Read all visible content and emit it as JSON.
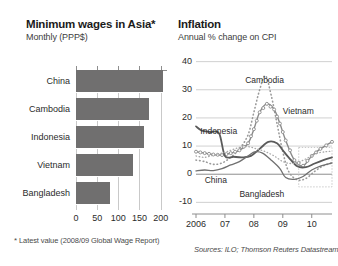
{
  "left": {
    "title": "Minimum wages in Asia*",
    "subtitle": "Monthly (PPP$)",
    "footnote_star": "*",
    "footnote": " Latest value (2008/09 Global Wage Report)"
  },
  "right": {
    "title": "Inflation",
    "subtitle": "Annual % change on CPI",
    "sources": "Sources: ILO; Thomson Reuters Datastream"
  },
  "chart_data": [
    {
      "type": "bar",
      "title": "Minimum wages in Asia*",
      "subtitle": "Monthly (PPP$)",
      "orientation": "horizontal",
      "categories": [
        "China",
        "Cambodia",
        "Indonesia",
        "Vietnam",
        "Bangladesh"
      ],
      "values": [
        205,
        172,
        160,
        135,
        80
      ],
      "xlabel": "",
      "ylabel": "",
      "xlim": [
        0,
        215
      ],
      "xticks": [
        0,
        50,
        100,
        150,
        200
      ],
      "xtick_labels": [
        "0",
        "50",
        "100",
        "150",
        "200"
      ],
      "grid": true,
      "bar_color": "#706f6f",
      "legend": "none"
    },
    {
      "type": "line",
      "title": "Inflation",
      "subtitle": "Annual % change on CPI",
      "xlabel": "",
      "ylabel": "",
      "ylim": [
        -12,
        42
      ],
      "yticks": [
        -10,
        0,
        10,
        20,
        30,
        40
      ],
      "ytick_labels": [
        "-10",
        "0",
        "10",
        "20",
        "30",
        "40"
      ],
      "xlim": [
        2006.0,
        2010.7
      ],
      "xticks": [
        2006,
        2007,
        2008,
        2009,
        2010
      ],
      "xtick_labels": [
        "2006",
        "07",
        "08",
        "09",
        "10"
      ],
      "grid": true,
      "legend": "inline-annotations",
      "series": [
        {
          "name": "Cambodia",
          "style": "dotted",
          "color": "#9a9a9a",
          "x": [
            2006.0,
            2006.3,
            2006.6,
            2006.9,
            2007.2,
            2007.5,
            2007.8,
            2008.0,
            2008.2,
            2008.4,
            2008.6,
            2008.8,
            2009.0,
            2009.2,
            2009.5,
            2009.8,
            2010.1,
            2010.4,
            2010.7
          ],
          "values": [
            5.0,
            4.5,
            3.5,
            4.0,
            6.0,
            9.0,
            14.0,
            22.0,
            30.0,
            35.0,
            28.0,
            18.0,
            8.0,
            1.0,
            -2.0,
            -1.5,
            1.0,
            3.0,
            4.0
          ]
        },
        {
          "name": "Vietnam",
          "style": "circle-markers",
          "color": "#8a8a8a",
          "x": [
            2006.0,
            2006.3,
            2006.6,
            2006.9,
            2007.2,
            2007.5,
            2007.8,
            2008.0,
            2008.2,
            2008.45,
            2008.7,
            2008.9,
            2009.1,
            2009.4,
            2009.7,
            2010.0,
            2010.3,
            2010.7
          ],
          "values": [
            8.0,
            7.5,
            7.0,
            6.8,
            7.5,
            8.5,
            11.0,
            16.0,
            22.0,
            25.0,
            23.0,
            18.0,
            12.0,
            5.0,
            3.0,
            6.5,
            9.0,
            11.5
          ]
        },
        {
          "name": "Indonesia",
          "style": "solid",
          "color": "#5a5a5a",
          "x": [
            2006.0,
            2006.2,
            2006.5,
            2006.8,
            2007.0,
            2007.3,
            2007.6,
            2007.9,
            2008.2,
            2008.5,
            2008.8,
            2009.0,
            2009.2,
            2009.5,
            2009.8,
            2010.1,
            2010.4,
            2010.7
          ],
          "values": [
            17.0,
            15.5,
            15.0,
            14.5,
            6.5,
            6.2,
            6.0,
            6.5,
            9.0,
            11.5,
            11.0,
            8.5,
            6.0,
            2.8,
            2.5,
            3.8,
            5.0,
            6.0
          ]
        },
        {
          "name": "China",
          "style": "solid-thin",
          "color": "#707070",
          "x": [
            2006.0,
            2006.3,
            2006.6,
            2006.9,
            2007.2,
            2007.5,
            2007.8,
            2008.05,
            2008.3,
            2008.6,
            2008.9,
            2009.1,
            2009.4,
            2009.7,
            2010.0,
            2010.3,
            2010.7
          ],
          "values": [
            1.2,
            1.5,
            1.3,
            2.0,
            3.3,
            4.5,
            6.5,
            8.0,
            7.5,
            5.0,
            2.0,
            -1.2,
            -1.8,
            -0.8,
            1.5,
            2.9,
            4.0
          ]
        },
        {
          "name": "Bangladesh",
          "style": "dotted-light",
          "color": "#a8a8a8",
          "x": [
            2006.0,
            2006.3,
            2006.6,
            2006.9,
            2007.2,
            2007.5,
            2007.8,
            2008.1,
            2008.4,
            2008.7,
            2009.0,
            2009.3,
            2009.6,
            2009.9,
            2010.2,
            2010.5,
            2010.7
          ],
          "values": [
            6.5,
            6.0,
            6.8,
            7.5,
            8.5,
            9.5,
            9.8,
            9.0,
            8.0,
            6.5,
            4.5,
            3.8,
            4.5,
            6.0,
            7.5,
            8.0,
            8.2
          ]
        }
      ],
      "annotations": [
        {
          "text": "Cambodia",
          "x": 2007.7,
          "y": 33
        },
        {
          "text": "Vietnam",
          "x": 2009.0,
          "y": 22
        },
        {
          "text": "Indonesia",
          "x": 2006.15,
          "y": 15
        },
        {
          "text": "China",
          "x": 2006.3,
          "y": -2.5
        },
        {
          "text": "Bangladesh",
          "x": 2007.5,
          "y": -7.5
        }
      ]
    }
  ],
  "bar_rows": [
    {
      "label": "China",
      "value": 205
    },
    {
      "label": "Cambodia",
      "value": 172
    },
    {
      "label": "Indonesia",
      "value": 160
    },
    {
      "label": "Vietnam",
      "value": 135
    },
    {
      "label": "Bangladesh",
      "value": 80
    }
  ],
  "bar_xticks": [
    "0",
    "50",
    "100",
    "150",
    "200"
  ],
  "line_yticks": [
    "40",
    "30",
    "20",
    "10",
    "0",
    "-10"
  ],
  "line_xticks": [
    "2006",
    "07",
    "08",
    "09",
    "10"
  ],
  "line_annotations": [
    "Cambodia",
    "Vietnam",
    "Indonesia",
    "China",
    "Bangladesh"
  ]
}
